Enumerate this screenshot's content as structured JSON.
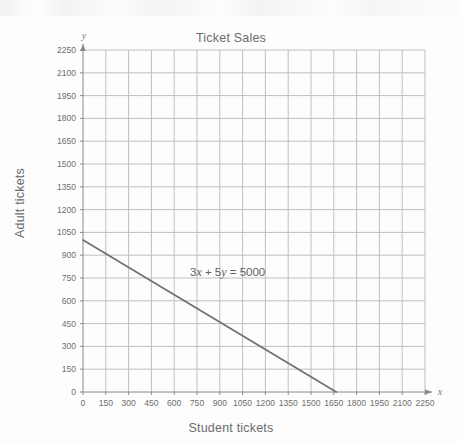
{
  "chart_data": {
    "type": "line",
    "title": "Ticket Sales",
    "xlabel": "Student tickets",
    "ylabel": "Adult tickets",
    "axis_letters": {
      "x": "x",
      "y": "y"
    },
    "annotation": {
      "text": "3x + 5y = 5000",
      "parts": [
        "3",
        "x",
        " + 5",
        "y",
        " = 5000"
      ],
      "x_value": 700,
      "y_value": 800
    },
    "xlim": [
      0,
      2250
    ],
    "ylim": [
      0,
      2250
    ],
    "grid": true,
    "legend": null,
    "xticks": [
      0,
      150,
      300,
      450,
      600,
      750,
      900,
      1050,
      1200,
      1350,
      1500,
      1650,
      1800,
      1950,
      2100,
      2250
    ],
    "yticks": [
      0,
      150,
      300,
      450,
      600,
      750,
      900,
      1050,
      1200,
      1350,
      1500,
      1650,
      1800,
      1950,
      2100,
      2250
    ],
    "xticklabels": [
      "0",
      "150",
      "300",
      "450",
      "600",
      "750",
      "900",
      "1050",
      "1200",
      "1350",
      "1500",
      "1650",
      "1800",
      "1950",
      "2100",
      "2250"
    ],
    "yticklabels": [
      "0",
      "150",
      "300",
      "450",
      "600",
      "750",
      "900",
      "1050",
      "1200",
      "1350",
      "1500",
      "1650",
      "1800",
      "1950",
      "2100",
      "2250"
    ],
    "series": [
      {
        "name": "3x + 5y = 5000",
        "equation": "3x + 5y = 5000",
        "color": "#6e6e6e",
        "x": [
          0,
          1666.67
        ],
        "y": [
          1000,
          0
        ],
        "points": [
          {
            "x": 0,
            "y": 1000
          },
          {
            "x": 1666.67,
            "y": 0
          }
        ]
      }
    ],
    "colors": {
      "grid": "#bfbfbf",
      "axis": "#8a8a8a",
      "line": "#6e6e6e",
      "text": "#6a6a6a",
      "background": "#fdfdfd"
    }
  }
}
